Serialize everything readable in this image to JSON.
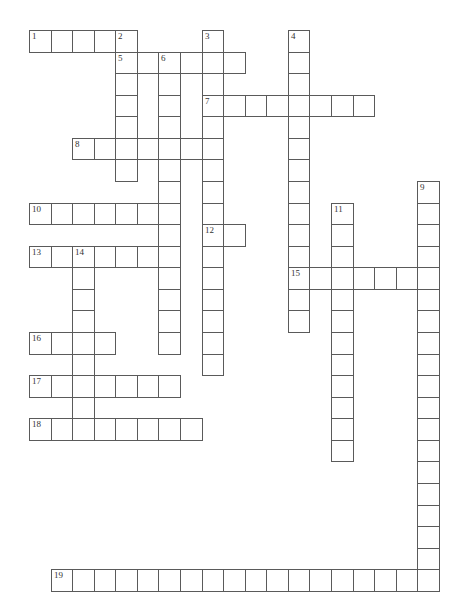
{
  "grid": {
    "origin_x": 29,
    "origin_y": 30,
    "cell_size": 21.57,
    "line_color": "#5a5a5a",
    "number_color": "#333333"
  },
  "entries": [
    {
      "number": "1",
      "direction": "across",
      "row": 0,
      "col": 0,
      "length": 5
    },
    {
      "number": "2",
      "direction": "down",
      "row": 0,
      "col": 4,
      "length": 7
    },
    {
      "number": "3",
      "direction": "down",
      "row": 0,
      "col": 8,
      "length": 16
    },
    {
      "number": "4",
      "direction": "down",
      "row": 0,
      "col": 12,
      "length": 14
    },
    {
      "number": "5",
      "direction": "across",
      "row": 1,
      "col": 4,
      "length": 6
    },
    {
      "number": "6",
      "direction": "down",
      "row": 1,
      "col": 6,
      "length": 14
    },
    {
      "number": "7",
      "direction": "across",
      "row": 3,
      "col": 8,
      "length": 8
    },
    {
      "number": "8",
      "direction": "across",
      "row": 5,
      "col": 2,
      "length": 7
    },
    {
      "number": "9",
      "direction": "down",
      "row": 7,
      "col": 18,
      "length": 19
    },
    {
      "number": "10",
      "direction": "across",
      "row": 8,
      "col": 0,
      "length": 7
    },
    {
      "number": "11",
      "direction": "down",
      "row": 8,
      "col": 14,
      "length": 12
    },
    {
      "number": "12",
      "direction": "across",
      "row": 9,
      "col": 8,
      "length": 2
    },
    {
      "number": "13",
      "direction": "across",
      "row": 10,
      "col": 0,
      "length": 7
    },
    {
      "number": "14",
      "direction": "down",
      "row": 10,
      "col": 2,
      "length": 9
    },
    {
      "number": "15",
      "direction": "across",
      "row": 11,
      "col": 12,
      "length": 7
    },
    {
      "number": "16",
      "direction": "across",
      "row": 14,
      "col": 0,
      "length": 4
    },
    {
      "number": "17",
      "direction": "across",
      "row": 16,
      "col": 0,
      "length": 7
    },
    {
      "number": "18",
      "direction": "across",
      "row": 18,
      "col": 0,
      "length": 8
    },
    {
      "number": "19",
      "direction": "across",
      "row": 25,
      "col": 1,
      "length": 18
    }
  ]
}
